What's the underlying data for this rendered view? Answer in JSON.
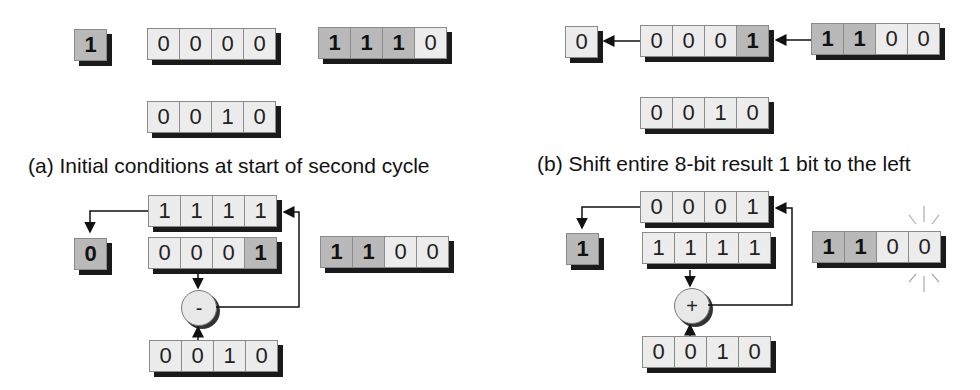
{
  "panels": {
    "a": {
      "caption": "(a) Initial conditions at start of second cycle",
      "registers": [
        {
          "id": "a-carry",
          "bits": [
            "1"
          ],
          "highlight": [
            true
          ]
        },
        {
          "id": "a-acc",
          "bits": [
            "0",
            "0",
            "0",
            "0"
          ],
          "highlight": [
            false,
            false,
            false,
            false
          ]
        },
        {
          "id": "a-q",
          "bits": [
            "1",
            "1",
            "1",
            "0"
          ],
          "highlight": [
            true,
            true,
            true,
            false
          ]
        },
        {
          "id": "a-div",
          "bits": [
            "0",
            "0",
            "1",
            "0"
          ],
          "highlight": [
            false,
            false,
            false,
            false
          ]
        }
      ]
    },
    "b": {
      "caption": "(b) Shift entire 8-bit result 1 bit to the left",
      "registers": [
        {
          "id": "b-carry",
          "bits": [
            "0"
          ],
          "highlight": [
            false
          ]
        },
        {
          "id": "b-acc",
          "bits": [
            "0",
            "0",
            "0",
            "1"
          ],
          "highlight": [
            false,
            false,
            false,
            true
          ]
        },
        {
          "id": "b-q",
          "bits": [
            "1",
            "1",
            "0",
            "0"
          ],
          "highlight": [
            true,
            true,
            false,
            false
          ]
        },
        {
          "id": "b-div",
          "bits": [
            "0",
            "0",
            "1",
            "0"
          ],
          "highlight": [
            false,
            false,
            false,
            false
          ]
        }
      ]
    },
    "c": {
      "operator": "-",
      "registers": [
        {
          "id": "c-result",
          "bits": [
            "1",
            "1",
            "1",
            "1"
          ],
          "highlight": [
            false,
            false,
            false,
            false
          ]
        },
        {
          "id": "c-carry",
          "bits": [
            "0"
          ],
          "highlight": [
            true
          ]
        },
        {
          "id": "c-acc",
          "bits": [
            "0",
            "0",
            "0",
            "1"
          ],
          "highlight": [
            false,
            false,
            false,
            true
          ]
        },
        {
          "id": "c-q",
          "bits": [
            "1",
            "1",
            "0",
            "0"
          ],
          "highlight": [
            true,
            true,
            false,
            false
          ]
        },
        {
          "id": "c-div",
          "bits": [
            "0",
            "0",
            "1",
            "0"
          ],
          "highlight": [
            false,
            false,
            false,
            false
          ]
        }
      ]
    },
    "d": {
      "operator": "+",
      "registers": [
        {
          "id": "d-result",
          "bits": [
            "0",
            "0",
            "0",
            "1"
          ],
          "highlight": [
            false,
            false,
            false,
            false
          ]
        },
        {
          "id": "d-carry",
          "bits": [
            "1"
          ],
          "highlight": [
            true
          ]
        },
        {
          "id": "d-acc",
          "bits": [
            "1",
            "1",
            "1",
            "1"
          ],
          "highlight": [
            false,
            false,
            false,
            false
          ]
        },
        {
          "id": "d-q",
          "bits": [
            "1",
            "1",
            "0",
            "0"
          ],
          "highlight": [
            true,
            true,
            false,
            false
          ]
        },
        {
          "id": "d-div",
          "bits": [
            "0",
            "0",
            "1",
            "0"
          ],
          "highlight": [
            false,
            false,
            false,
            false
          ]
        }
      ]
    }
  },
  "layout": {
    "a-carry": [
      74,
      29
    ],
    "a-acc": [
      147,
      28
    ],
    "a-q": [
      318,
      27
    ],
    "a-div": [
      147,
      101
    ],
    "b-carry": [
      565,
      26
    ],
    "b-acc": [
      640,
      25
    ],
    "b-q": [
      811,
      23
    ],
    "b-div": [
      640,
      97
    ],
    "c-result": [
      148,
      195
    ],
    "c-carry": [
      74,
      238
    ],
    "c-acc": [
      148,
      237
    ],
    "c-q": [
      320,
      236
    ],
    "c-div": [
      149,
      340
    ],
    "d-result": [
      640,
      191
    ],
    "d-carry": [
      566,
      233
    ],
    "d-acc": [
      642,
      232
    ],
    "d-q": [
      812,
      231
    ],
    "d-div": [
      642,
      336
    ]
  },
  "colors": {
    "highlight": "#b9b9b9",
    "cell": "#ececec",
    "shadow": "#1a1a1a"
  }
}
